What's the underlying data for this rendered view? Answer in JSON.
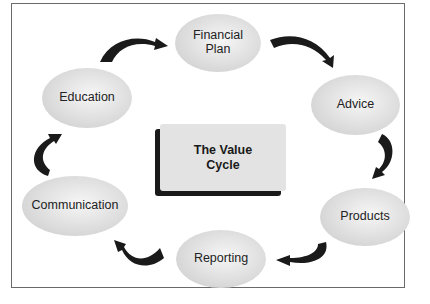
{
  "diagram": {
    "title_lines": [
      "The Value",
      "Cycle"
    ],
    "nodes": [
      {
        "id": "financial-plan",
        "label_lines": [
          "Financial",
          "Plan"
        ]
      },
      {
        "id": "advice",
        "label_lines": [
          "Advice"
        ]
      },
      {
        "id": "products",
        "label_lines": [
          "Products"
        ]
      },
      {
        "id": "reporting",
        "label_lines": [
          "Reporting"
        ]
      },
      {
        "id": "communication",
        "label_lines": [
          "Communication"
        ]
      },
      {
        "id": "education",
        "label_lines": [
          "Education"
        ]
      }
    ],
    "edges": [
      {
        "from": "education",
        "to": "financial-plan"
      },
      {
        "from": "financial-plan",
        "to": "advice"
      },
      {
        "from": "advice",
        "to": "products"
      },
      {
        "from": "products",
        "to": "reporting"
      },
      {
        "from": "reporting",
        "to": "communication"
      },
      {
        "from": "communication",
        "to": "education"
      }
    ],
    "colors": {
      "node_fill": "#d6d6d6",
      "arrow": "#1a1a1a",
      "center_fill": "#e3e3e3",
      "border": "#6a6a6a"
    }
  }
}
